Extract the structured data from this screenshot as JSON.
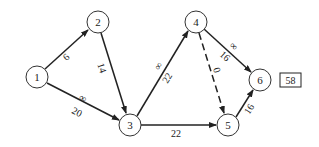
{
  "diagram": {
    "type": "network",
    "nodes": [
      {
        "id": "1",
        "label": "1",
        "x": 37,
        "y": 77
      },
      {
        "id": "2",
        "label": "2",
        "x": 98,
        "y": 22
      },
      {
        "id": "3",
        "label": "3",
        "x": 130,
        "y": 125
      },
      {
        "id": "4",
        "label": "4",
        "x": 196,
        "y": 22
      },
      {
        "id": "5",
        "label": "5",
        "x": 228,
        "y": 125
      },
      {
        "id": "6",
        "label": "6",
        "x": 260,
        "y": 80
      }
    ],
    "edges": [
      {
        "from": "1",
        "to": "2",
        "weight": "6",
        "critical_mark": "",
        "dashed": false
      },
      {
        "from": "2",
        "to": "3",
        "weight": "14",
        "critical_mark": "",
        "dashed": false
      },
      {
        "from": "1",
        "to": "3",
        "weight": "20",
        "critical_mark": "∞",
        "dashed": false
      },
      {
        "from": "3",
        "to": "4",
        "weight": "22",
        "critical_mark": "∞",
        "dashed": false
      },
      {
        "from": "3",
        "to": "5",
        "weight": "22",
        "critical_mark": "",
        "dashed": false
      },
      {
        "from": "4",
        "to": "5",
        "weight": "0",
        "critical_mark": "",
        "dashed": true
      },
      {
        "from": "4",
        "to": "6",
        "weight": "16",
        "critical_mark": "∞",
        "dashed": false
      },
      {
        "from": "5",
        "to": "6",
        "weight": "16",
        "critical_mark": "",
        "dashed": false
      }
    ],
    "result_box": "58"
  }
}
